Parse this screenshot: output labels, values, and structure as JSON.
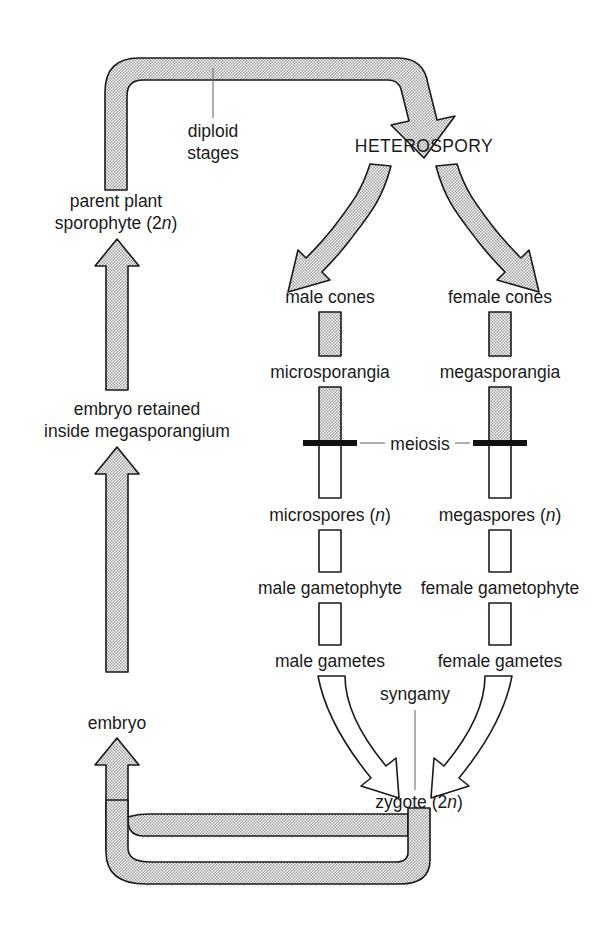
{
  "diagram": {
    "colors": {
      "stipple_fill": "#d8d8d8",
      "outline": "#1a1a1a",
      "haploid_fill": "#ffffff",
      "leader_line": "#6e6e6e",
      "background": "#ffffff"
    },
    "labels": {
      "diploid_stages": "diploid\nstages",
      "diploid_stages_line1": "diploid",
      "diploid_stages_line2": "stages",
      "heterospory": "HETEROSPORY",
      "parent_plant_line1": "parent plant",
      "parent_plant_line2_pre": "sporophyte (2",
      "parent_plant_line2_ital": "n",
      "parent_plant_line2_post": ")",
      "embryo_retained_line1": "embryo retained",
      "embryo_retained_line2": "inside megasporangium",
      "embryo": "embryo",
      "male_cones": "male cones",
      "female_cones": "female cones",
      "microsporangia": "microsporangia",
      "megasporangia": "megasporangia",
      "meiosis": "meiosis",
      "microspores_pre": "microspores (",
      "microspores_ital": "n",
      "microspores_post": ")",
      "megaspores_pre": "megaspores (",
      "megaspores_ital": "n",
      "megaspores_post": ")",
      "male_gametophyte": "male gametophyte",
      "female_gametophyte": "female gametophyte",
      "male_gametes": "male gametes",
      "female_gametes": "female gametes",
      "syngamy": "syngamy",
      "zygote_pre": "zygote (2",
      "zygote_ital": "n",
      "zygote_post": ")"
    },
    "stages": {
      "diploid_sequence": [
        "parent plant sporophyte (2n)",
        "HETEROSPORY",
        "male cones",
        "female cones",
        "microsporangia",
        "megasporangia"
      ],
      "haploid_sequence": [
        "microspores (n)",
        "megaspores (n)",
        "male gametophyte",
        "female gametophyte",
        "male gametes",
        "female gametes"
      ],
      "transitions": [
        "meiosis",
        "syngamy"
      ],
      "diploid_return": [
        "zygote (2n)",
        "embryo",
        "embryo retained inside megasporangium",
        "parent plant sporophyte (2n)"
      ]
    }
  }
}
